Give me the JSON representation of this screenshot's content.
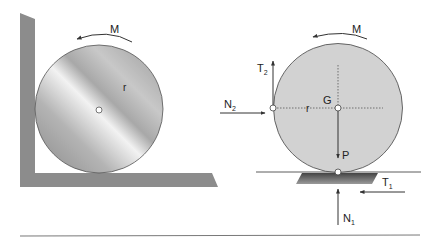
{
  "figure_left": {
    "title": "Cylinder against wall and floor",
    "moment_label": "M",
    "radius_label": "r"
  },
  "figure_right": {
    "title": "Free body diagram",
    "moment_label": "M",
    "center_label": "G",
    "radius_label": "r",
    "weight_label": "P",
    "wall_normal": {
      "base": "N",
      "sub": "2"
    },
    "wall_friction": {
      "base": "T",
      "sub": "2"
    },
    "floor_normal": {
      "base": "N",
      "sub": "1"
    },
    "floor_friction": {
      "base": "T",
      "sub": "1"
    }
  },
  "colors": {
    "wall": "#8c8c8c",
    "disk_fill": "#cfcfcf",
    "line": "#333333",
    "text": "#222222"
  }
}
